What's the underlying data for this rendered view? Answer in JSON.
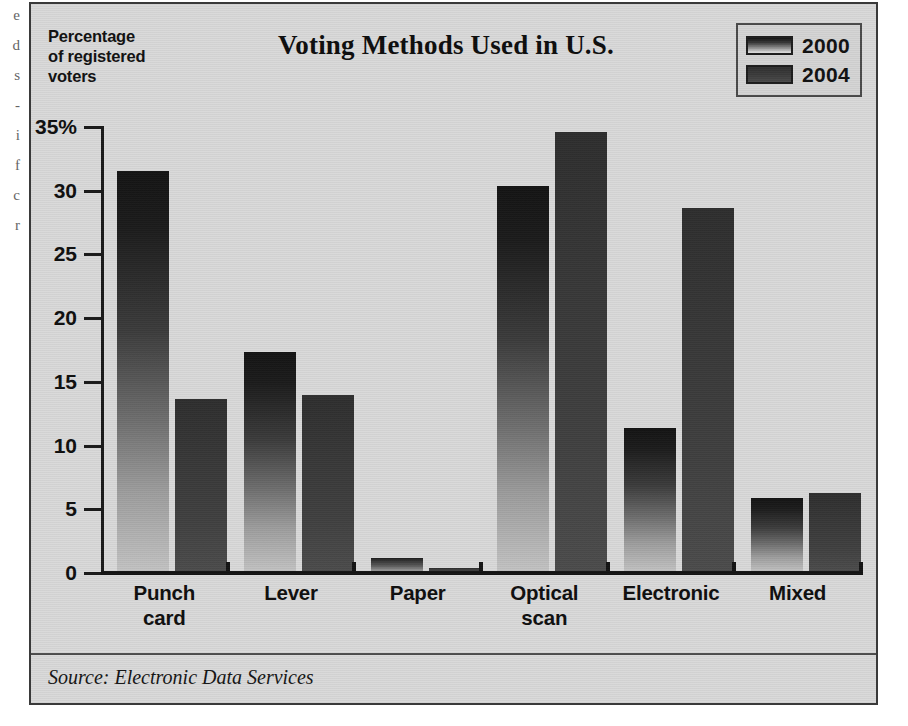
{
  "figure": {
    "title": "Voting Methods Used in U.S.",
    "axis_caption_lines": [
      "Percentage",
      "of registered",
      "voters"
    ],
    "source": "Source: Electronic Data Services",
    "background_color": "#d9d9d9",
    "frame_color": "#3a3a3a"
  },
  "edge_sliver": {
    "fragments": [
      "e",
      "d",
      "s",
      "-",
      "i",
      "f",
      "c",
      "r"
    ]
  },
  "legend": {
    "position": "top-right",
    "entries": [
      {
        "label": "2000",
        "swatch": "gradient-dark-to-light",
        "color": "#141414"
      },
      {
        "label": "2004",
        "swatch": "solid-dark-gray",
        "color": "#3b3b3b"
      }
    ]
  },
  "chart_data": {
    "type": "bar",
    "title": "Voting Methods Used in U.S.",
    "xlabel": "",
    "ylabel": "Percentage of registered voters",
    "ylim": [
      0,
      35
    ],
    "ytick_labels": [
      "0",
      "5",
      "10",
      "15",
      "20",
      "25",
      "30",
      "35%"
    ],
    "yticks": [
      0,
      5,
      10,
      15,
      20,
      25,
      30,
      35
    ],
    "grid": false,
    "legend_position": "top-right",
    "categories": [
      "Punch card",
      "Lever",
      "Paper",
      "Optical scan",
      "Electronic",
      "Mixed"
    ],
    "category_label_lines": [
      [
        "Punch",
        "card"
      ],
      [
        "Lever"
      ],
      [
        "Paper"
      ],
      [
        "Optical",
        "scan"
      ],
      [
        "Electronic"
      ],
      [
        "Mixed"
      ]
    ],
    "series": [
      {
        "name": "2000",
        "color": "#141414",
        "values": [
          31.5,
          17.3,
          1.1,
          30.3,
          11.3,
          5.8
        ]
      },
      {
        "name": "2004",
        "color": "#3b3b3b",
        "values": [
          13.6,
          13.9,
          0.3,
          34.5,
          28.6,
          6.2
        ]
      }
    ],
    "source": "Source: Electronic Data Services"
  }
}
